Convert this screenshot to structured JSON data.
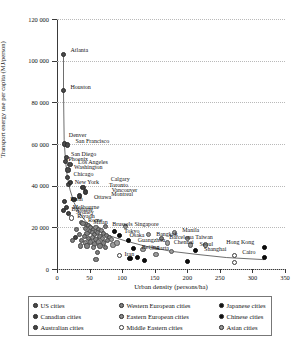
{
  "chart_data": {
    "type": "scatter",
    "title": "",
    "xlabel": "Urban density (persons/ha)",
    "ylabel": "Transport energy use per capita (MJ/person)",
    "xlim": [
      0,
      350
    ],
    "ylim": [
      0,
      120000
    ],
    "xticks": [
      "0",
      "50",
      "100",
      "150",
      "200",
      "250",
      "300",
      "350"
    ],
    "yticks": [
      "0",
      "20 000",
      "40 000",
      "60 000",
      "80 000",
      "100 000",
      "120 000"
    ],
    "grid": "horizontal-dotted",
    "legend_position": "below-plot",
    "series": [
      {
        "name": "US cities",
        "key": "us",
        "color": "#4a4a4a",
        "marker": "filled-circle"
      },
      {
        "name": "Canadian cities",
        "key": "canadian",
        "color": "#3d3d3d",
        "marker": "filled-circle"
      },
      {
        "name": "Australian cities",
        "key": "australian",
        "color": "#454545",
        "marker": "filled-circle"
      },
      {
        "name": "Western European cities",
        "key": "weu",
        "color": "#808080",
        "marker": "filled-circle"
      },
      {
        "name": "Eastern European cities",
        "key": "eeu",
        "color": "#8d8d8d",
        "marker": "filled-circle"
      },
      {
        "name": "Middle Eastern cities",
        "key": "meast",
        "color": "#ffffff",
        "marker": "open-circle"
      },
      {
        "name": "Japanese cities",
        "key": "japanese",
        "color": "#111111",
        "marker": "filled-circle"
      },
      {
        "name": "Chinese cities",
        "key": "chinese",
        "color": "#0d0d0d",
        "marker": "filled-circle"
      },
      {
        "name": "Asian cities",
        "key": "asian",
        "color": "#9a9a9a",
        "marker": "filled-circle"
      }
    ],
    "points": [
      {
        "label": "Atlanta",
        "x": 10,
        "y": 103000,
        "g": "us",
        "lx": 7,
        "ly": -7
      },
      {
        "label": "Houston",
        "x": 10,
        "y": 85500,
        "g": "us",
        "lx": 7,
        "ly": -7
      },
      {
        "label": "Denver",
        "x": 12,
        "y": 60000,
        "g": "us",
        "lx": 4,
        "ly": -12
      },
      {
        "label": "San Francisco",
        "x": 16,
        "y": 59500,
        "g": "us",
        "lx": 8,
        "ly": -7
      },
      {
        "label": "San Diego",
        "x": 14,
        "y": 53500,
        "g": "us",
        "lx": 5,
        "ly": -7
      },
      {
        "label": "Phoenix",
        "x": 13,
        "y": 51500,
        "g": "us",
        "lx": 3,
        "ly": -6
      },
      {
        "label": "Los Angeles",
        "x": 20,
        "y": 50000,
        "g": "us",
        "lx": 8,
        "ly": -6
      },
      {
        "label": "Washington",
        "x": 17,
        "y": 47500,
        "g": "us",
        "lx": 6,
        "ly": -6
      },
      {
        "label": "Chicago",
        "x": 16,
        "y": 44000,
        "g": "us",
        "lx": 6,
        "ly": -6
      },
      {
        "label": "New York",
        "x": 18,
        "y": 40500,
        "g": "us",
        "lx": 6,
        "ly": -6
      },
      {
        "label": "Calgary",
        "x": 21,
        "y": 41500,
        "g": "canadian",
        "lx": 40,
        "ly": -7
      },
      {
        "label": "Toronto",
        "x": 40,
        "y": 39000,
        "g": "canadian",
        "lx": 26,
        "ly": -6
      },
      {
        "label": "Vancouver",
        "x": 44,
        "y": 37000,
        "g": "canadian",
        "lx": 26,
        "ly": -5
      },
      {
        "label": "Montreal",
        "x": 34,
        "y": 35000,
        "g": "canadian",
        "lx": 32,
        "ly": -5
      },
      {
        "label": "Ottawa",
        "x": 26,
        "y": 33500,
        "g": "canadian",
        "lx": 20,
        "ly": -5
      },
      {
        "label": "Perth",
        "x": 11,
        "y": 32500,
        "g": "australian",
        "lx": 6,
        "ly": -5
      },
      {
        "label": "Melbourne",
        "x": 15,
        "y": 29500,
        "g": "australian",
        "lx": 6,
        "ly": -4
      },
      {
        "label": "Brisbane",
        "x": 10,
        "y": 28000,
        "g": "australian",
        "lx": 8,
        "ly": -5
      },
      {
        "label": "Sydney",
        "x": 18,
        "y": 26500,
        "g": "australian",
        "lx": 7,
        "ly": -5
      },
      {
        "label": "Riyadh",
        "x": 22,
        "y": 24500,
        "g": "meast",
        "lx": 6,
        "ly": -5
      },
      {
        "label": "Rome",
        "x": 37,
        "y": 22500,
        "g": "weu",
        "lx": 7,
        "ly": -5
      },
      {
        "label": "Milan",
        "x": 45,
        "y": 21500,
        "g": "weu",
        "lx": 7,
        "ly": -5
      },
      {
        "label": "Brussels",
        "x": 74,
        "y": 20500,
        "g": "weu",
        "lx": 7,
        "ly": -5
      },
      {
        "label": "Singapore",
        "x": 105,
        "y": 20500,
        "g": "asian",
        "lx": 9,
        "ly": -5
      },
      {
        "label": "Tokyo",
        "x": 88,
        "y": 18000,
        "g": "japanese",
        "lx": 10,
        "ly": -4
      },
      {
        "label": "Osaka",
        "x": 96,
        "y": 16000,
        "g": "japanese",
        "lx": 10,
        "ly": -4
      },
      {
        "label": "Bangkok",
        "x": 140,
        "y": 16500,
        "g": "asian",
        "lx": 8,
        "ly": -4
      },
      {
        "label": "Manila",
        "x": 180,
        "y": 17500,
        "g": "asian",
        "lx": 8,
        "ly": -6
      },
      {
        "label": "Barcelona",
        "x": 160,
        "y": 14500,
        "g": "weu",
        "lx": 8,
        "ly": -5
      },
      {
        "label": "Taiwan",
        "x": 200,
        "y": 14500,
        "g": "asian",
        "lx": 8,
        "ly": -5
      },
      {
        "label": "Guangzhou",
        "x": 110,
        "y": 13500,
        "g": "chinese",
        "lx": 9,
        "ly": -4
      },
      {
        "label": "Chennai",
        "x": 170,
        "y": 12500,
        "g": "asian",
        "lx": 6,
        "ly": -4
      },
      {
        "label": "Seoul",
        "x": 205,
        "y": 11500,
        "g": "asian",
        "lx": 9,
        "ly": -4
      },
      {
        "label": "Beijing",
        "x": 118,
        "y": 10000,
        "g": "chinese",
        "lx": 8,
        "ly": -4
      },
      {
        "label": "Jakarta",
        "x": 132,
        "y": 9500,
        "g": "asian",
        "lx": 9,
        "ly": -4
      },
      {
        "label": "Shanghai",
        "x": 212,
        "y": 9000,
        "g": "chinese",
        "lx": 9,
        "ly": -4
      },
      {
        "label": "Cairo",
        "x": 272,
        "y": 6500,
        "g": "meast",
        "lx": 8,
        "ly": -6
      },
      {
        "label": "Hong Kong",
        "x": 318,
        "y": 10500,
        "g": "chinese",
        "lx": -38,
        "ly": -8
      },
      {
        "label": "Iran",
        "x": 96,
        "y": 6500,
        "g": "meast",
        "lx": 5,
        "ly": -4
      },
      {
        "label": "",
        "x": 62,
        "y": 8000,
        "g": "weu",
        "lx": 0,
        "ly": 0
      },
      {
        "label": "",
        "x": 40,
        "y": 22000,
        "g": "weu",
        "lx": 0,
        "ly": 0
      },
      {
        "label": "",
        "x": 48,
        "y": 21000,
        "g": "weu",
        "lx": 0,
        "ly": 0
      },
      {
        "label": "",
        "x": 52,
        "y": 20000,
        "g": "weu",
        "lx": 0,
        "ly": 0
      },
      {
        "label": "",
        "x": 44,
        "y": 19500,
        "g": "weu",
        "lx": 0,
        "ly": 0
      },
      {
        "label": "",
        "x": 56,
        "y": 19000,
        "g": "weu",
        "lx": 0,
        "ly": 0
      },
      {
        "label": "",
        "x": 60,
        "y": 20000,
        "g": "eeu",
        "lx": 0,
        "ly": 0
      },
      {
        "label": "",
        "x": 64,
        "y": 19000,
        "g": "weu",
        "lx": 0,
        "ly": 0
      },
      {
        "label": "",
        "x": 50,
        "y": 18000,
        "g": "weu",
        "lx": 0,
        "ly": 0
      },
      {
        "label": "",
        "x": 46,
        "y": 17000,
        "g": "weu",
        "lx": 0,
        "ly": 0
      },
      {
        "label": "",
        "x": 54,
        "y": 17500,
        "g": "eeu",
        "lx": 0,
        "ly": 0
      },
      {
        "label": "",
        "x": 58,
        "y": 16500,
        "g": "weu",
        "lx": 0,
        "ly": 0
      },
      {
        "label": "",
        "x": 62,
        "y": 17500,
        "g": "weu",
        "lx": 0,
        "ly": 0
      },
      {
        "label": "",
        "x": 68,
        "y": 18500,
        "g": "eeu",
        "lx": 0,
        "ly": 0
      },
      {
        "label": "",
        "x": 72,
        "y": 17000,
        "g": "weu",
        "lx": 0,
        "ly": 0
      },
      {
        "label": "",
        "x": 42,
        "y": 15500,
        "g": "weu",
        "lx": 0,
        "ly": 0
      },
      {
        "label": "",
        "x": 48,
        "y": 14500,
        "g": "weu",
        "lx": 0,
        "ly": 0
      },
      {
        "label": "",
        "x": 54,
        "y": 15000,
        "g": "eeu",
        "lx": 0,
        "ly": 0
      },
      {
        "label": "",
        "x": 60,
        "y": 14000,
        "g": "weu",
        "lx": 0,
        "ly": 0
      },
      {
        "label": "",
        "x": 66,
        "y": 15500,
        "g": "weu",
        "lx": 0,
        "ly": 0
      },
      {
        "label": "",
        "x": 70,
        "y": 14500,
        "g": "eeu",
        "lx": 0,
        "ly": 0
      },
      {
        "label": "",
        "x": 76,
        "y": 16000,
        "g": "weu",
        "lx": 0,
        "ly": 0
      },
      {
        "label": "",
        "x": 80,
        "y": 15000,
        "g": "weu",
        "lx": 0,
        "ly": 0
      },
      {
        "label": "",
        "x": 38,
        "y": 13500,
        "g": "weu",
        "lx": 0,
        "ly": 0
      },
      {
        "label": "",
        "x": 44,
        "y": 12500,
        "g": "eeu",
        "lx": 0,
        "ly": 0
      },
      {
        "label": "",
        "x": 52,
        "y": 13000,
        "g": "weu",
        "lx": 0,
        "ly": 0
      },
      {
        "label": "",
        "x": 58,
        "y": 12000,
        "g": "weu",
        "lx": 0,
        "ly": 0
      },
      {
        "label": "",
        "x": 64,
        "y": 13000,
        "g": "eeu",
        "lx": 0,
        "ly": 0
      },
      {
        "label": "",
        "x": 72,
        "y": 12500,
        "g": "weu",
        "lx": 0,
        "ly": 0
      },
      {
        "label": "",
        "x": 78,
        "y": 13500,
        "g": "weu",
        "lx": 0,
        "ly": 0
      },
      {
        "label": "",
        "x": 84,
        "y": 14000,
        "g": "asian",
        "lx": 0,
        "ly": 0
      },
      {
        "label": "",
        "x": 46,
        "y": 11000,
        "g": "weu",
        "lx": 0,
        "ly": 0
      },
      {
        "label": "",
        "x": 56,
        "y": 10500,
        "g": "eeu",
        "lx": 0,
        "ly": 0
      },
      {
        "label": "",
        "x": 66,
        "y": 11000,
        "g": "weu",
        "lx": 0,
        "ly": 0
      },
      {
        "label": "",
        "x": 74,
        "y": 10500,
        "g": "weu",
        "lx": 0,
        "ly": 0
      },
      {
        "label": "",
        "x": 86,
        "y": 11500,
        "g": "asian",
        "lx": 0,
        "ly": 0
      },
      {
        "label": "",
        "x": 92,
        "y": 12500,
        "g": "asian",
        "lx": 0,
        "ly": 0
      },
      {
        "label": "",
        "x": 30,
        "y": 19000,
        "g": "weu",
        "lx": 0,
        "ly": 0
      },
      {
        "label": "",
        "x": 34,
        "y": 16500,
        "g": "weu",
        "lx": 0,
        "ly": 0
      },
      {
        "label": "",
        "x": 28,
        "y": 15000,
        "g": "australian",
        "lx": 0,
        "ly": 0
      },
      {
        "label": "",
        "x": 24,
        "y": 13500,
        "g": "weu",
        "lx": 0,
        "ly": 0
      },
      {
        "label": "",
        "x": 36,
        "y": 11000,
        "g": "weu",
        "lx": 0,
        "ly": 0
      },
      {
        "label": "",
        "x": 60,
        "y": 4500,
        "g": "weu",
        "lx": 0,
        "ly": 0
      },
      {
        "label": "",
        "x": 112,
        "y": 5000,
        "g": "chinese",
        "lx": 0,
        "ly": 0
      },
      {
        "label": "",
        "x": 124,
        "y": 5500,
        "g": "chinese",
        "lx": 0,
        "ly": 0
      },
      {
        "label": "",
        "x": 134,
        "y": 4000,
        "g": "chinese",
        "lx": 0,
        "ly": 0
      },
      {
        "label": "",
        "x": 152,
        "y": 7000,
        "g": "asian",
        "lx": 0,
        "ly": 0
      },
      {
        "label": "",
        "x": 176,
        "y": 8500,
        "g": "asian",
        "lx": 0,
        "ly": 0
      },
      {
        "label": "",
        "x": 200,
        "y": 3500,
        "g": "chinese",
        "lx": 0,
        "ly": 0
      },
      {
        "label": "",
        "x": 228,
        "y": 11500,
        "g": "asian",
        "lx": 0,
        "ly": 0
      },
      {
        "label": "",
        "x": 272,
        "y": 3000,
        "g": "meast",
        "lx": 0,
        "ly": 0
      },
      {
        "label": "",
        "x": 318,
        "y": 5500,
        "g": "chinese",
        "lx": 0,
        "ly": 0
      }
    ],
    "trend_curve": [
      [
        10,
        103000
      ],
      [
        10,
        85000
      ],
      [
        11,
        62000
      ],
      [
        13,
        52000
      ],
      [
        16,
        44000
      ],
      [
        20,
        38000
      ],
      [
        26,
        32000
      ],
      [
        34,
        27000
      ],
      [
        45,
        22500
      ],
      [
        60,
        19000
      ],
      [
        80,
        16000
      ],
      [
        105,
        13500
      ],
      [
        135,
        11000
      ],
      [
        175,
        8500
      ],
      [
        215,
        7000
      ],
      [
        260,
        5500
      ],
      [
        318,
        4500
      ]
    ]
  }
}
